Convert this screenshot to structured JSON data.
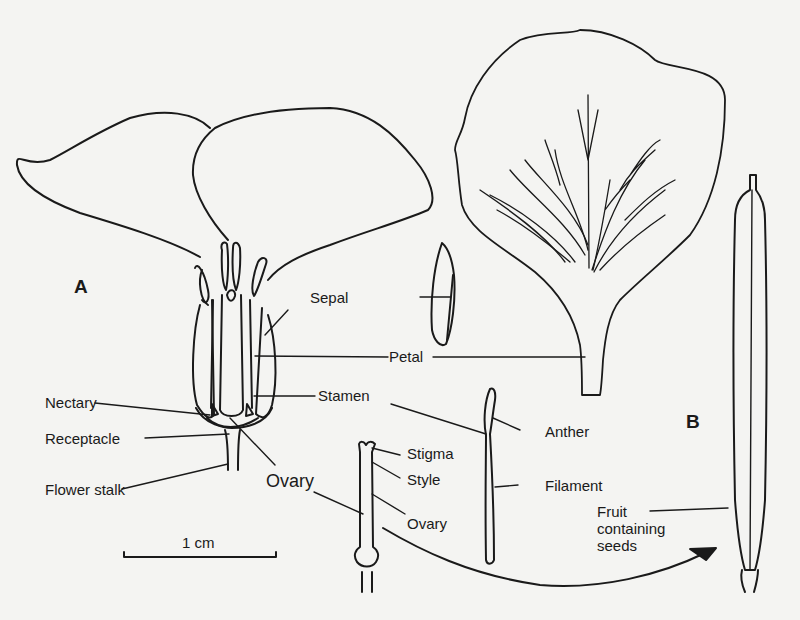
{
  "diagram": {
    "panels": [
      {
        "id": "A",
        "label": "A"
      },
      {
        "id": "B",
        "label": "B"
      }
    ],
    "labels": {
      "sepal": "Sepal",
      "petal": "Petal",
      "stamen": "Stamen",
      "nectary": "Nectary",
      "receptacle": "Receptacle",
      "flower_stalk": "Flower stalk",
      "ovary_main": "Ovary",
      "stigma": "Stigma",
      "style": "Style",
      "ovary_detail": "Ovary",
      "anther": "Anther",
      "filament": "Filament",
      "fruit_line1": "Fruit",
      "fruit_line2": "containing",
      "fruit_line3": "seeds"
    },
    "scale_bar": {
      "label": "1 cm"
    },
    "colors": {
      "background": "#f4f4f2",
      "ink": "#1a1a1a"
    }
  }
}
